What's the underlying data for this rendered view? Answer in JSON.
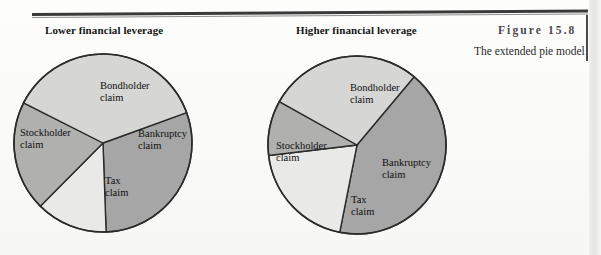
{
  "figure": {
    "number": "Figure 15.8",
    "caption": "The extended pie model"
  },
  "charts": [
    {
      "id": "lower",
      "title": "Lower financial leverage",
      "labels": {
        "bondholder": "Bondholder\nclaim",
        "stockholder": "Stockholder\nclaim",
        "bankruptcy": "Bankruptcy\nclaim",
        "tax": "Tax\nclaim"
      }
    },
    {
      "id": "higher",
      "title": "Higher financial leverage",
      "labels": {
        "bondholder": "Bondholder\nclaim",
        "stockholder": "Stockholder\nclaim",
        "bankruptcy": "Bankruptcy\nclaim",
        "tax": "Tax\nclaim"
      }
    }
  ],
  "colors": {
    "bondholder": "#a6a6a6",
    "stockholder": "#d6d6d4",
    "bankruptcy": "#e9e9e7",
    "tax": "#b0b0ae",
    "outline": "#2b2b2b",
    "rule": "#3a3a3a",
    "page_background": "#fbfbfa",
    "figure_number": "#4a4a52"
  },
  "chart_data": [
    {
      "type": "pie",
      "title": "Lower financial leverage",
      "categories": [
        "Bondholder claim",
        "Bankruptcy claim",
        "Tax claim",
        "Stockholder claim"
      ],
      "values": [
        30,
        13,
        20,
        37
      ],
      "unit": "percent of firm value",
      "start_angle_deg": -20,
      "direction": "clockwise",
      "legend": "none",
      "grid": false,
      "labels_inside": true
    },
    {
      "type": "pie",
      "title": "Higher financial leverage",
      "categories": [
        "Bondholder claim",
        "Bankruptcy claim",
        "Tax claim",
        "Stockholder claim"
      ],
      "values": [
        42,
        20,
        10,
        28
      ],
      "unit": "percent of firm value",
      "start_angle_deg": -50,
      "direction": "clockwise",
      "legend": "none",
      "grid": false,
      "labels_inside": true
    }
  ]
}
